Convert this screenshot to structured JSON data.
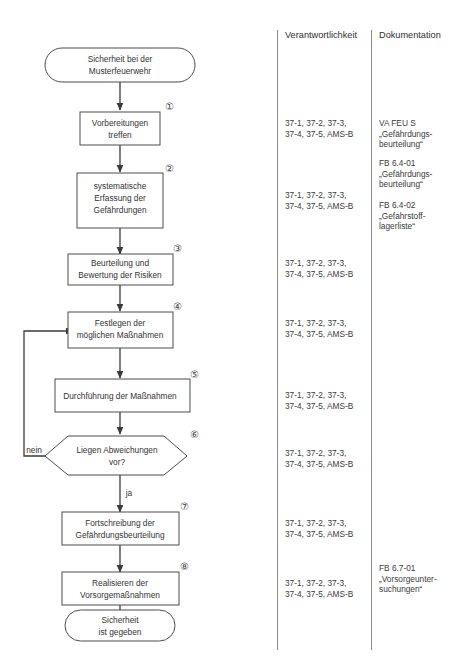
{
  "diagram": {
    "title_columns": {
      "responsibility_header": "Verantwortlichkeit",
      "documentation_header": "Dokumentation"
    },
    "start_node": {
      "line1": "Sicherheit bei der",
      "line2": "Musterfeuerwehr"
    },
    "end_node": {
      "line1": "Sicherheit",
      "line2": "ist gegeben"
    },
    "steps": [
      {
        "number": "①",
        "line1": "Vorbereitungen",
        "line2": "treffen",
        "line3": ""
      },
      {
        "number": "②",
        "line1": "systematische",
        "line2": "Erfassung der",
        "line3": "Gefährdungen"
      },
      {
        "number": "③",
        "line1": "Beurteilung und",
        "line2": "Bewertung der Risiken",
        "line3": ""
      },
      {
        "number": "④",
        "line1": "Festlegen der",
        "line2": "möglichen Maßnahmen",
        "line3": ""
      },
      {
        "number": "⑤",
        "line1": "Durchführung der Maßnahmen",
        "line2": "",
        "line3": ""
      },
      {
        "number": "⑥",
        "line1": "Liegen Abweichungen",
        "line2": "vor?",
        "line3": ""
      },
      {
        "number": "⑦",
        "line1": "Fortschreibung der",
        "line2": "Gefährdungsbeurteilung",
        "line3": ""
      },
      {
        "number": "⑧",
        "line1": "Realisieren der",
        "line2": "Vorsorgemaßnahmen",
        "line3": ""
      }
    ],
    "branch_labels": {
      "no": "nein",
      "yes": "ja"
    },
    "responsibility_cells": [
      "37-1, 37-2, 37-3,\n37-4, 37-5, AMS-B",
      "37-1, 37-2, 37-3,\n37-4, 37-5, AMS-B",
      "37-1, 37-2, 37-3,\n37-4, 37-5, AMS-B",
      "37-1, 37-2, 37-3,\n37-4, 37-5, AMS-B",
      "37-1, 37-2, 37-3,\n37-4, 37-5, AMS-B",
      "37-1, 37-2, 37-3,\n37-4, 37-5, AMS-B",
      "37-1, 37-2, 37-3,\n37-4, 37-5, AMS-B",
      "37-1, 37-2, 37-3,\n37-4, 37-5, AMS-B"
    ],
    "documentation_cells": [
      "VA FEU S\n„Gefährdungs-\nbeurteilung“",
      "FB 6.4-01\n„Gefährdungs-\nbeurteilung“",
      "FB 6.4-02\n„Gefahrstoff-\nlagerliste“",
      "FB 6.7-01\n„Vorsorgeunter-\nsuchungen“"
    ],
    "colors": {
      "shape_stroke": "#4d4d4d",
      "connector": "#3a3a3a",
      "text": "#333333",
      "divider": "#8c8c8c",
      "background": "#ffffff"
    }
  }
}
